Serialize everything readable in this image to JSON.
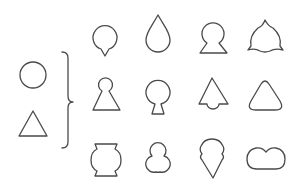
{
  "diagram": {
    "colors": {
      "background": "#ffffff",
      "stroke": "#4a4a4a"
    },
    "source_shapes": [
      {
        "id": "circle",
        "label": "circle"
      },
      {
        "id": "triangle",
        "label": "triangle"
      }
    ],
    "connector": {
      "type": "right-curly-brace"
    },
    "options": {
      "rows": 3,
      "columns": 4,
      "items": [
        {
          "row": 1,
          "col": 1,
          "label": "circle-with-bottom-point"
        },
        {
          "row": 1,
          "col": 2,
          "label": "teardrop"
        },
        {
          "row": 1,
          "col": 3,
          "label": "keyhole-circle-on-trapezoid"
        },
        {
          "row": 1,
          "col": 4,
          "label": "rounded-triangle-with-three-points"
        },
        {
          "row": 2,
          "col": 1,
          "label": "pawn-small-circle-on-trapezoid"
        },
        {
          "row": 2,
          "col": 2,
          "label": "circle-on-small-stand"
        },
        {
          "row": 2,
          "col": 3,
          "label": "bell-triangle-with-bottom-bump"
        },
        {
          "row": 2,
          "col": 4,
          "label": "rounded-triangle"
        },
        {
          "row": 3,
          "col": 1,
          "label": "vase"
        },
        {
          "row": 3,
          "col": 2,
          "label": "trefoil"
        },
        {
          "row": 3,
          "col": 3,
          "label": "ice-cream-cone"
        },
        {
          "row": 3,
          "col": 4,
          "label": "cloud-lips"
        }
      ]
    }
  }
}
